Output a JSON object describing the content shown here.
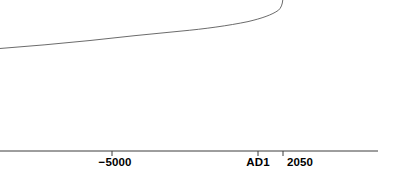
{
  "figure": {
    "background_color": "#ffffff",
    "width": 397,
    "height": 192
  },
  "axis": {
    "name": "x-axis",
    "color": "#3c3c3c",
    "line_y": 151,
    "line_x_start": 0,
    "line_x_end": 378,
    "tick_length": 5,
    "ticks": [
      {
        "label": "−5000",
        "x": 112,
        "label_x": 115,
        "label_y": 157
      },
      {
        "label": "AD1",
        "x": 258,
        "label_x": 258,
        "label_y": 157
      },
      {
        "label": "2050",
        "x": 283,
        "label_x": 300,
        "label_y": 157
      }
    ]
  },
  "curve": {
    "name": "population-growth-curve",
    "color": "#5a5a5a",
    "stroke_width": 0.9,
    "path": "M 0,48.5 C 30,46.2 60,43.6 90,40.5 C 120,37.1 150,34.0 180,31.2 C 205,28.9 228,25.7 248,21.6 C 262,18.3 272,14.8 278.5,10.2 C 281,8.0 282.4,4.5 282.8,0"
  },
  "chart_data": {
    "type": "line",
    "title": "",
    "xlabel": "",
    "ylabel": "",
    "grid": false,
    "legend": null,
    "xticks": [
      "−5000",
      "AD1",
      "2050"
    ],
    "xtick_values": [
      -5000,
      1,
      2050
    ],
    "x": [
      -10000,
      -8500,
      -7000,
      -5500,
      -4000,
      -2500,
      -1000,
      200,
      1000,
      1500,
      1800,
      1900,
      1950,
      2000,
      2050
    ],
    "y": [
      0.08,
      0.1,
      0.12,
      0.15,
      0.18,
      0.22,
      0.26,
      0.3,
      0.34,
      0.42,
      0.55,
      0.72,
      0.85,
      0.97,
      1.0
    ],
    "series": [
      {
        "name": "growth",
        "values": [
          0.08,
          0.1,
          0.12,
          0.15,
          0.18,
          0.22,
          0.26,
          0.3,
          0.34,
          0.42,
          0.55,
          0.72,
          0.85,
          0.97,
          1.0
        ]
      }
    ],
    "xlim": [
      -11000,
      2600
    ],
    "ylim": [
      0,
      1.05
    ]
  }
}
